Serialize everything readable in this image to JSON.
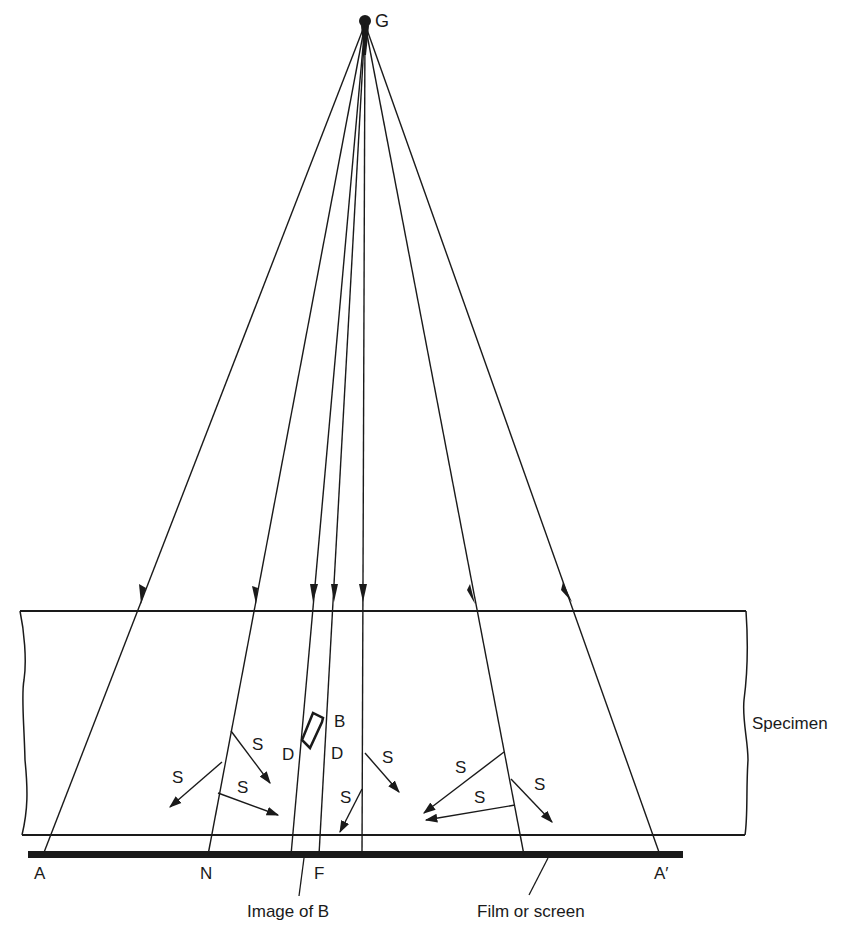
{
  "diagram": {
    "source_label": "G",
    "specimen_label": "Specimen",
    "film_label": "Film or screen",
    "image_label": "Image of B",
    "defect_label": "B",
    "film_points": {
      "A": "A",
      "N": "N",
      "F": "F",
      "A_prime": "A′"
    },
    "diffraction_labels": [
      "D",
      "D"
    ],
    "scatter_label": "S",
    "scatter_labels": [
      "S",
      "S",
      "S",
      "S",
      "S",
      "S",
      "S",
      "S"
    ],
    "colors": {
      "ink": "#1a1a1a",
      "background": "#ffffff"
    }
  }
}
